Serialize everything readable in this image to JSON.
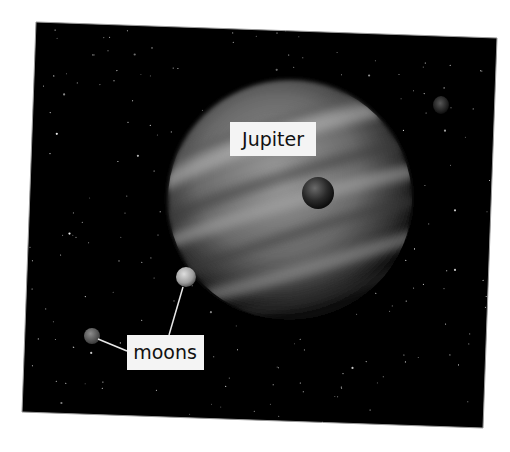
{
  "image": {
    "description": "Photograph of Jupiter with moons against a starry sky",
    "labels": {
      "planet": "Jupiter",
      "moons": "moons"
    },
    "colors": {
      "sky": "#000000",
      "label_bg": "#f4f4f4",
      "label_text": "#111111",
      "leader_line": "#e8e8e8"
    }
  }
}
